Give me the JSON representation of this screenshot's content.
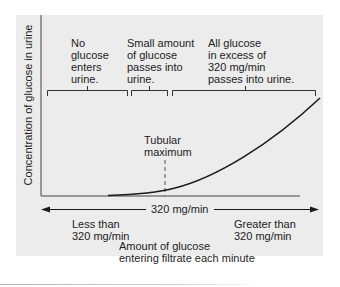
{
  "diagram": {
    "y_axis_label": "Concentration of glucose in urine",
    "x_axis_label_line1": "Amount of glucose",
    "x_axis_label_line2": "entering filtrate each minute",
    "regions": [
      {
        "lines": [
          "No",
          "glucose",
          "enters",
          "urine."
        ]
      },
      {
        "lines": [
          "Small amount",
          "of glucose",
          "passes into",
          "urine."
        ]
      },
      {
        "lines": [
          "All glucose",
          "in excess of",
          "320 mg/min",
          "passes into urine."
        ]
      }
    ],
    "threshold_label_line1": "Tubular",
    "threshold_label_line2": "maximum",
    "arrow_center_label": "320 mg/min",
    "left_label_line1": "Less than",
    "left_label_line2": "320 mg/min",
    "right_label_line1": "Greater than",
    "right_label_line2": "320 mg/min"
  },
  "colors": {
    "panel_background": "#ececec",
    "line": "#1a1a1a",
    "text": "#222222"
  }
}
